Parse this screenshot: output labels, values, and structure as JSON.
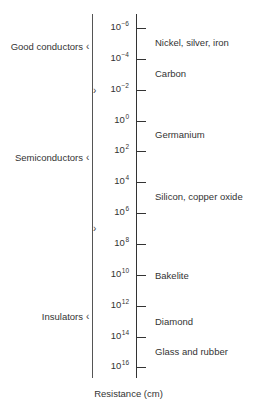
{
  "diagram": {
    "axis_label": "Resistance (cm)",
    "ticks": [
      {
        "base": "10",
        "exp": "−6",
        "y": 28
      },
      {
        "base": "10",
        "exp": "−4",
        "y": 59
      },
      {
        "base": "10",
        "exp": "−2",
        "y": 90
      },
      {
        "base": "10",
        "exp": "0",
        "y": 121
      },
      {
        "base": "10",
        "exp": "2",
        "y": 151
      },
      {
        "base": "10",
        "exp": "4",
        "y": 182
      },
      {
        "base": "10",
        "exp": "6",
        "y": 213
      },
      {
        "base": "10",
        "exp": "8",
        "y": 244
      },
      {
        "base": "10",
        "exp": "10",
        "y": 275
      },
      {
        "base": "10",
        "exp": "12",
        "y": 306
      },
      {
        "base": "10",
        "exp": "14",
        "y": 337
      },
      {
        "base": "10",
        "exp": "16",
        "y": 367
      }
    ],
    "materials": [
      {
        "label": "Nickel, silver, iron",
        "y": 43
      },
      {
        "label": "Carbon",
        "y": 74
      },
      {
        "label": "Germanium",
        "y": 135
      },
      {
        "label": "Silicon, copper oxide",
        "y": 197
      },
      {
        "label": "Bakelite",
        "y": 276
      },
      {
        "label": "Diamond",
        "y": 321
      },
      {
        "label": "Glass and rubber",
        "y": 352
      }
    ],
    "categories": [
      {
        "label": "Good conductors",
        "y": 47,
        "top": 14,
        "bottom": 91
      },
      {
        "label": "Semiconductors",
        "y": 158,
        "top": 91,
        "bottom": 229
      },
      {
        "label": "Insulators",
        "y": 317,
        "top": 229,
        "bottom": 378
      }
    ]
  }
}
